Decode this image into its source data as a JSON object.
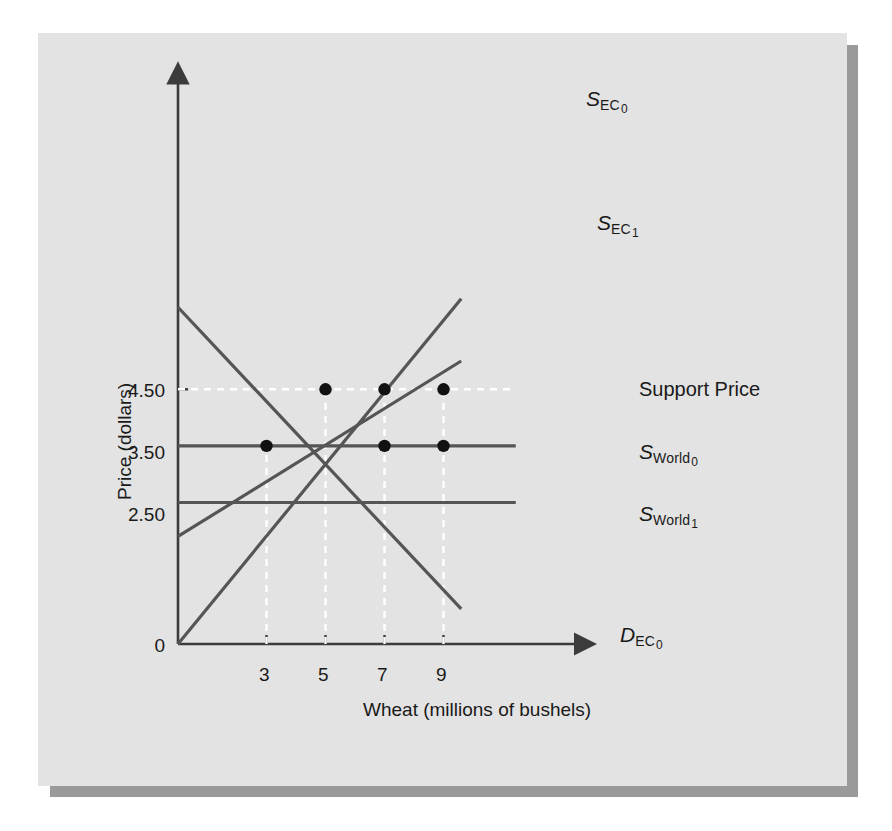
{
  "figure": {
    "background_color": "#e3e3e3",
    "shadow_color": "#9a9a9a",
    "line_color": "#555555",
    "dash_color": "#ffffff",
    "marker_color": "#111111"
  },
  "chart_data": {
    "type": "line",
    "title": "",
    "xlabel": "Wheat (millions of bushels)",
    "ylabel": "Price (dollars)",
    "xlim": [
      0,
      13.5
    ],
    "ylim": [
      0,
      6.6
    ],
    "grid": false,
    "x_tick_labels": [
      "3",
      "5",
      "7",
      "9"
    ],
    "x_tick_values": [
      3,
      5,
      7,
      9
    ],
    "y_tick_labels": [
      "4.50",
      "3.50",
      "2.50"
    ],
    "y_tick_values": [
      4.5,
      3.5,
      2.5
    ],
    "origin_label": "0",
    "series": [
      {
        "name": "S EC 0",
        "label_main": "S",
        "label_sub": "EC",
        "label_sub2": "0",
        "kind": "supply",
        "points": [
          [
            0,
            0
          ],
          [
            9.6,
            6.1
          ]
        ]
      },
      {
        "name": "S EC 1",
        "label_main": "S",
        "label_sub": "EC",
        "label_sub2": "1",
        "kind": "supply",
        "points": [
          [
            0,
            1.9
          ],
          [
            9.6,
            5.0
          ]
        ]
      },
      {
        "name": "D EC 0",
        "label_main": "D",
        "label_sub": "EC",
        "label_sub2": "0",
        "kind": "demand",
        "points": [
          [
            0,
            5.95
          ],
          [
            9.6,
            0.62
          ]
        ]
      },
      {
        "name": "S World 0",
        "label_main": "S",
        "label_sub": "World",
        "label_sub2": "0",
        "kind": "world-price",
        "price": 3.5,
        "points": [
          [
            0,
            3.5
          ],
          [
            11.45,
            3.5
          ]
        ]
      },
      {
        "name": "S World 1",
        "label_main": "S",
        "label_sub": "World",
        "label_sub2": "1",
        "kind": "world-price",
        "price": 2.5,
        "points": [
          [
            0,
            2.5
          ],
          [
            11.45,
            2.5
          ]
        ]
      }
    ],
    "annotations": [
      {
        "name": "support-price",
        "text": "Support Price",
        "price": 4.5
      }
    ],
    "dashed_guides": {
      "horizontal": [
        {
          "value": 4.5,
          "x_end": 11.45
        }
      ],
      "vertical": [
        {
          "value": 3,
          "y_end": 3.5
        },
        {
          "value": 5,
          "y_end": 4.5
        },
        {
          "value": 7,
          "y_end": 4.5
        },
        {
          "value": 9,
          "y_end": 4.5
        }
      ]
    },
    "markers": [
      {
        "x": 5,
        "y": 4.5
      },
      {
        "x": 7,
        "y": 4.5
      },
      {
        "x": 9,
        "y": 4.5
      },
      {
        "x": 3,
        "y": 3.5
      },
      {
        "x": 7,
        "y": 3.5
      },
      {
        "x": 9,
        "y": 3.5
      }
    ]
  }
}
